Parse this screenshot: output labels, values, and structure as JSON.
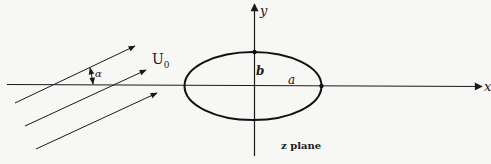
{
  "figure": {
    "type": "diagram",
    "axes": {
      "x_label": "x",
      "y_label": "y"
    },
    "ellipse": {
      "semi_major_label": "a",
      "semi_minor_label": "b"
    },
    "flow": {
      "velocity_label": "U",
      "velocity_subscript": "0",
      "angle_label": "α",
      "arrow_count": 3
    },
    "plane_label": "z plane",
    "colors": {
      "background": "#f7f7f5",
      "ink": "#1a1a1a"
    }
  }
}
